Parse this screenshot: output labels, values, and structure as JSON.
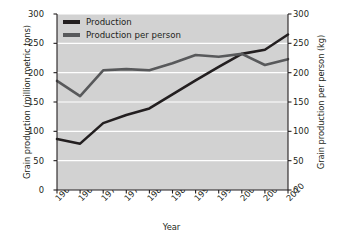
{
  "chart_data": {
    "type": "line",
    "title": "",
    "xlabel": "Year",
    "ylabel": "Grain production (million metric tons)",
    "ylabel_right": "Grain production per person (kg)",
    "categories": [
      "1960",
      "1965",
      "1970",
      "1975",
      "1980",
      "1985",
      "1990",
      "1995",
      "2000",
      "2005",
      "2010"
    ],
    "x": [
      1960,
      1965,
      1970,
      1975,
      1980,
      1985,
      1990,
      1995,
      2000,
      2005,
      2010
    ],
    "xlim": [
      1960,
      2010
    ],
    "ylim": [
      0,
      300
    ],
    "ylim_right": [
      0,
      300
    ],
    "yticks": [
      0,
      50,
      100,
      150,
      200,
      250,
      300
    ],
    "yticks_right": [
      0,
      50,
      100,
      150,
      200,
      250,
      300
    ],
    "grid": true,
    "grid_color": "#ffffff",
    "plot_background": "#d2d2d2",
    "legend_position": "top-left",
    "series": [
      {
        "name": "Production",
        "axis": "left",
        "units": "million metric tons",
        "color": "#231f20",
        "values": [
          87,
          79,
          114,
          128,
          139,
          163,
          187,
          210,
          232,
          239,
          265
        ]
      },
      {
        "name": "Production per person",
        "axis": "right",
        "units": "kg",
        "color": "#58595b",
        "values": [
          186,
          160,
          204,
          206,
          204,
          216,
          230,
          227,
          232,
          213,
          223
        ]
      }
    ]
  },
  "legend": {
    "items": [
      {
        "label": "Production",
        "color": "#231f20"
      },
      {
        "label": "Production per person",
        "color": "#58595b"
      }
    ]
  },
  "axes": {
    "x_title": "Year",
    "y_left_title": "Grain production (million metric tons)",
    "y_right_title": "Grain production per person (kg)"
  }
}
